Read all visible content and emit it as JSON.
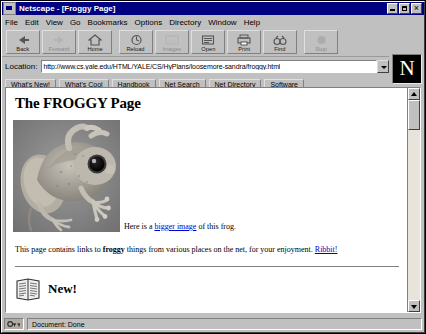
{
  "window": {
    "title": "Netscape - [Froggy Page]",
    "app_icon": "netscape-window-icon",
    "controls": [
      {
        "name": "minimize",
        "glyph": "minimize-icon"
      },
      {
        "name": "maximize",
        "glyph": "maximize-icon"
      },
      {
        "name": "close",
        "glyph": "close-icon"
      }
    ]
  },
  "menu": {
    "items": [
      {
        "label": "File"
      },
      {
        "label": "Edit"
      },
      {
        "label": "View"
      },
      {
        "label": "Go"
      },
      {
        "label": "Bookmarks"
      },
      {
        "label": "Options"
      },
      {
        "label": "Directory"
      },
      {
        "label": "Window"
      },
      {
        "label": "Help"
      }
    ]
  },
  "toolbar": {
    "buttons": [
      {
        "label": "Back",
        "icon": "back-arrow-icon",
        "enabled": true
      },
      {
        "label": "Forward",
        "icon": "forward-arrow-icon",
        "enabled": false
      },
      {
        "label": "Home",
        "icon": "home-icon",
        "enabled": true
      },
      {
        "label": "Reload",
        "icon": "reload-icon",
        "enabled": true
      },
      {
        "label": "Images",
        "icon": "images-icon",
        "enabled": false
      },
      {
        "label": "Open",
        "icon": "open-icon",
        "enabled": true
      },
      {
        "label": "Print",
        "icon": "print-icon",
        "enabled": true
      },
      {
        "label": "Find",
        "icon": "find-binoculars-icon",
        "enabled": true
      },
      {
        "label": "Stop",
        "icon": "stop-icon",
        "enabled": false
      }
    ]
  },
  "location": {
    "label": "Location:",
    "url": "http://www.cs.yale.edu/HTML/YALE/CS/HyPlans/loosemore-sandra/froggy.html",
    "placeholder": "Location:",
    "dropdown_icon": "chevron-down-icon"
  },
  "logo": {
    "letter": "N",
    "name": "netscape-logo"
  },
  "directory_bar": {
    "buttons": [
      {
        "label": "What's New!"
      },
      {
        "label": "What's Cool"
      },
      {
        "label": "Handbook"
      },
      {
        "label": "Net Search"
      },
      {
        "label": "Net Directory"
      },
      {
        "label": "Software"
      }
    ]
  },
  "page": {
    "heading": "The FROGGY Page",
    "frog_image_alt": "photo of a tree frog",
    "caption_prefix": "Here is a ",
    "caption_link": "bigger image",
    "caption_suffix": " of this frog.",
    "paragraph_part1": "This page contains links to ",
    "paragraph_bold": "froggy",
    "paragraph_part2": " things from various places on the net, for your enjoyment. ",
    "paragraph_link": "Ribbit!",
    "new_section_label": "New!",
    "new_section_icon": "newspaper-icon"
  },
  "scrollbar": {
    "up_icon": "scroll-up-arrow-icon",
    "down_icon": "scroll-down-arrow-icon",
    "thumb_position_percent": 2
  },
  "statusbar": {
    "security_icon": "broken-key-icon",
    "text": "Document: Done"
  },
  "colors": {
    "titlebar": "#000080",
    "chrome": "#c0c0c0",
    "page_background": "#ffffff",
    "link": "#0000cc",
    "text": "#000000"
  }
}
